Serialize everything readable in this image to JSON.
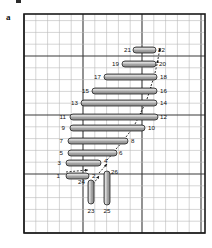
{
  "figure": {
    "panel_letter": "a",
    "grid": {
      "x": 24,
      "y": 14,
      "width": 181,
      "height": 219,
      "minor_step": 11.8,
      "major_every": 5,
      "minor_color": "#b8b8b8",
      "major_color": "#3a3a3a",
      "border_color": "#1a1a1a"
    },
    "bar_style": {
      "fill": "#a8a8a8",
      "stroke": "#1a1a1a",
      "highlight": "#d8d8d8"
    },
    "bars": [
      {
        "id": "bar-21-22",
        "orientation": "horizontal",
        "x1": 133,
        "x2": 156,
        "y": 50,
        "thickness": 6,
        "label_left": "21",
        "label_right": "22"
      },
      {
        "id": "bar-19-20",
        "orientation": "horizontal",
        "x1": 122,
        "x2": 156,
        "y": 64,
        "thickness": 6,
        "label_left": "19",
        "label_right": "20"
      },
      {
        "id": "bar-17-18",
        "orientation": "horizontal",
        "x1": 104,
        "x2": 157,
        "y": 77,
        "thickness": 6,
        "label_left": "17",
        "label_right": "18"
      },
      {
        "id": "bar-15-16",
        "orientation": "horizontal",
        "x1": 92,
        "x2": 157,
        "y": 91,
        "thickness": 6,
        "label_left": "15",
        "label_right": "16"
      },
      {
        "id": "bar-13-14",
        "orientation": "horizontal",
        "x1": 81,
        "x2": 157,
        "y": 103,
        "thickness": 6,
        "label_left": "13",
        "label_right": "14"
      },
      {
        "id": "bar-11-12",
        "orientation": "horizontal",
        "x1": 70,
        "x2": 158,
        "y": 117,
        "thickness": 6,
        "label_left": "11",
        "label_right": "12"
      },
      {
        "id": "bar-9-10",
        "orientation": "horizontal",
        "x1": 70,
        "x2": 145,
        "y": 128,
        "thickness": 6,
        "label_left": "9",
        "label_right": "10"
      },
      {
        "id": "bar-7-8",
        "orientation": "horizontal",
        "x1": 68,
        "x2": 128,
        "y": 141,
        "thickness": 6,
        "label_left": "7",
        "label_right": "8"
      },
      {
        "id": "bar-5-6",
        "orientation": "horizontal",
        "x1": 68,
        "x2": 117,
        "y": 153,
        "thickness": 6,
        "label_left": "5",
        "label_right": "6"
      },
      {
        "id": "bar-3-4",
        "orientation": "horizontal",
        "x1": 66,
        "x2": 101,
        "y": 163,
        "thickness": 6,
        "label_left": "3",
        "label_right": "4"
      },
      {
        "id": "bar-1-2",
        "orientation": "horizontal",
        "x1": 66,
        "x2": 89,
        "y": 176,
        "thickness": 6,
        "label_left": "1",
        "label_right": "2"
      },
      {
        "id": "bar-23-24",
        "orientation": "vertical",
        "x": 91,
        "y1": 180,
        "y2": 204,
        "thickness": 6,
        "label_left": "24",
        "label_right": "23"
      },
      {
        "id": "bar-25-26",
        "orientation": "vertical",
        "x": 107,
        "y1": 171,
        "y2": 205,
        "thickness": 6,
        "label_left": "25",
        "label_right": "26"
      }
    ],
    "labels": [
      {
        "id": "label-1",
        "text": "1",
        "x": 60,
        "y": 178,
        "anchor": "end"
      },
      {
        "id": "label-2",
        "text": "2",
        "x": 92,
        "y": 178,
        "anchor": "start"
      },
      {
        "id": "label-3",
        "text": "3",
        "x": 61,
        "y": 165,
        "anchor": "end"
      },
      {
        "id": "label-4",
        "text": "4",
        "x": 104,
        "y": 163,
        "anchor": "start"
      },
      {
        "id": "label-5",
        "text": "5",
        "x": 63,
        "y": 155,
        "anchor": "end"
      },
      {
        "id": "label-6",
        "text": "6",
        "x": 119,
        "y": 155,
        "anchor": "start"
      },
      {
        "id": "label-7",
        "text": "7",
        "x": 63,
        "y": 143,
        "anchor": "end"
      },
      {
        "id": "label-8",
        "text": "8",
        "x": 131,
        "y": 143,
        "anchor": "start"
      },
      {
        "id": "label-9",
        "text": "9",
        "x": 65,
        "y": 130,
        "anchor": "end"
      },
      {
        "id": "label-10",
        "text": "10",
        "x": 148,
        "y": 130,
        "anchor": "start"
      },
      {
        "id": "label-11",
        "text": "11",
        "x": 66,
        "y": 119,
        "anchor": "end"
      },
      {
        "id": "label-12",
        "text": "12",
        "x": 160,
        "y": 119,
        "anchor": "start"
      },
      {
        "id": "label-13",
        "text": "13",
        "x": 78,
        "y": 105,
        "anchor": "end"
      },
      {
        "id": "label-14",
        "text": "14",
        "x": 160,
        "y": 105,
        "anchor": "start"
      },
      {
        "id": "label-15",
        "text": "15",
        "x": 89,
        "y": 93,
        "anchor": "end"
      },
      {
        "id": "label-16",
        "text": "16",
        "x": 160,
        "y": 93,
        "anchor": "start"
      },
      {
        "id": "label-17",
        "text": "17",
        "x": 101,
        "y": 79,
        "anchor": "end"
      },
      {
        "id": "label-18",
        "text": "18",
        "x": 160,
        "y": 79,
        "anchor": "start"
      },
      {
        "id": "label-19",
        "text": "19",
        "x": 119,
        "y": 66,
        "anchor": "end"
      },
      {
        "id": "label-20",
        "text": "20",
        "x": 159,
        "y": 66,
        "anchor": "start"
      },
      {
        "id": "label-21",
        "text": "21",
        "x": 131,
        "y": 52,
        "anchor": "end"
      },
      {
        "id": "label-22",
        "text": "22",
        "x": 158,
        "y": 52,
        "anchor": "start"
      },
      {
        "id": "label-23",
        "text": "23",
        "x": 91,
        "y": 213,
        "anchor": "middle"
      },
      {
        "id": "label-24",
        "text": "24",
        "x": 85,
        "y": 184,
        "anchor": "end"
      },
      {
        "id": "label-25",
        "text": "25",
        "x": 107,
        "y": 213,
        "anchor": "middle"
      },
      {
        "id": "label-26",
        "text": "26",
        "x": 111,
        "y": 174,
        "anchor": "start"
      }
    ],
    "arrows": [
      {
        "id": "arrow-a",
        "x1": 66,
        "y1": 172,
        "x2": 88,
        "y2": 170
      },
      {
        "id": "arrow-b",
        "x1": 89,
        "y1": 190,
        "x2": 99,
        "y2": 176
      },
      {
        "id": "arrow-c",
        "x1": 99,
        "y1": 173,
        "x2": 107,
        "y2": 164
      },
      {
        "id": "arrow-d",
        "x1": 107,
        "y1": 160,
        "x2": 116,
        "y2": 150
      },
      {
        "id": "arrow-e",
        "x1": 116,
        "y1": 149,
        "x2": 126,
        "y2": 138
      },
      {
        "id": "arrow-f",
        "x1": 126,
        "y1": 137,
        "x2": 135,
        "y2": 125
      },
      {
        "id": "arrow-g",
        "x1": 135,
        "y1": 124,
        "x2": 141,
        "y2": 113
      },
      {
        "id": "arrow-h",
        "x1": 141,
        "y1": 112,
        "x2": 147,
        "y2": 100
      },
      {
        "id": "arrow-i",
        "x1": 147,
        "y1": 99,
        "x2": 151,
        "y2": 87
      },
      {
        "id": "arrow-j",
        "x1": 151,
        "y1": 86,
        "x2": 155,
        "y2": 74
      },
      {
        "id": "arrow-k",
        "x1": 155,
        "y1": 73,
        "x2": 158,
        "y2": 60
      },
      {
        "id": "arrow-l",
        "x1": 158,
        "y1": 59,
        "x2": 160,
        "y2": 48
      }
    ]
  }
}
